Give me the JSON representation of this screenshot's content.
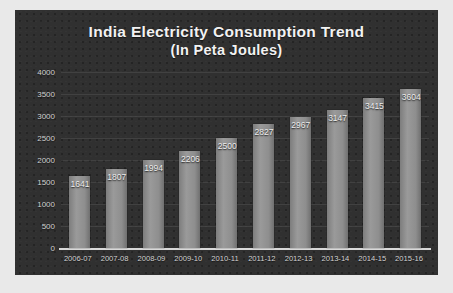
{
  "chart_data": {
    "type": "bar",
    "title": "India Electricity Consumption Trend",
    "subtitle": "(In Peta Joules)",
    "title_line1": "India Electricity Consumption Trend",
    "title_line2": "(In Peta Joules)",
    "xlabel": "",
    "ylabel": "",
    "ylim": [
      0,
      4000
    ],
    "yticks": [
      0,
      500,
      1000,
      1500,
      2000,
      2500,
      3000,
      3500,
      4000
    ],
    "ytick_labels": [
      "0",
      "500",
      "1000",
      "1500",
      "2000",
      "2500",
      "3000",
      "3500",
      "4000"
    ],
    "grid": true,
    "legend": false,
    "categories": [
      "2006-07",
      "2007-08",
      "2008-09",
      "2009-10",
      "2010-11",
      "2011-12",
      "2012-13",
      "2013-14",
      "2014-15",
      "2015-16"
    ],
    "values": [
      1641,
      1807,
      1994,
      2206,
      2500,
      2827,
      2967,
      3147,
      3415,
      3604
    ],
    "data_labels": [
      "1641",
      "1807",
      "1994",
      "2206",
      "2500",
      "2827",
      "2967",
      "3147",
      "3415",
      "3604"
    ],
    "colors": {
      "background": "#303030",
      "bar": "#8e8e8e",
      "text": "#f2f2f2",
      "tick_text": "#cfcfcf",
      "gridline": "#4a4a4a",
      "axis": "#d8d8d8",
      "page": "#e9e9e9"
    }
  }
}
